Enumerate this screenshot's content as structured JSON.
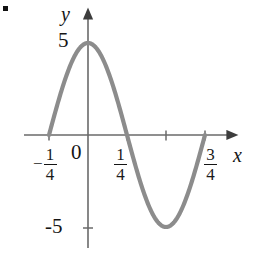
{
  "figure": {
    "marker": "•",
    "axis_labels": {
      "x": "x",
      "y": "y"
    },
    "origin_label": "0"
  },
  "chart_data": {
    "type": "line",
    "title": "",
    "xlabel": "x",
    "ylabel": "y",
    "grid": false,
    "legend": null,
    "xlim": [
      -0.375,
      0.9
    ],
    "ylim": [
      -6.5,
      6.5
    ],
    "x_ticks": [
      {
        "value": -0.25,
        "label": "-1/4",
        "numerator": "1",
        "denominator": "4",
        "sign": "−"
      },
      {
        "value": 0.25,
        "label": "1/4",
        "numerator": "1",
        "denominator": "4",
        "sign": ""
      },
      {
        "value": 0.5,
        "label": "",
        "numerator": "",
        "denominator": "",
        "sign": ""
      },
      {
        "value": 0.75,
        "label": "3/4",
        "numerator": "3",
        "denominator": "4",
        "sign": ""
      }
    ],
    "y_ticks": [
      {
        "value": 5,
        "label": "5"
      },
      {
        "value": -5,
        "label": "-5"
      }
    ],
    "series": [
      {
        "name": "y = 5 cos(2πx)",
        "color": "#8c8c8c",
        "amplitude": 5,
        "period": 1,
        "x_start": -0.25,
        "x_end": 0.75,
        "key_points": [
          {
            "x": -0.25,
            "y": 0
          },
          {
            "x": 0,
            "y": 5
          },
          {
            "x": 0.25,
            "y": 0
          },
          {
            "x": 0.5,
            "y": -5
          },
          {
            "x": 0.75,
            "y": 0
          }
        ]
      }
    ]
  },
  "style": {
    "curve_color": "#8c8c8c",
    "axis_color": "#5a5a5a",
    "text_color": "#151515",
    "background": "#ffffff"
  }
}
